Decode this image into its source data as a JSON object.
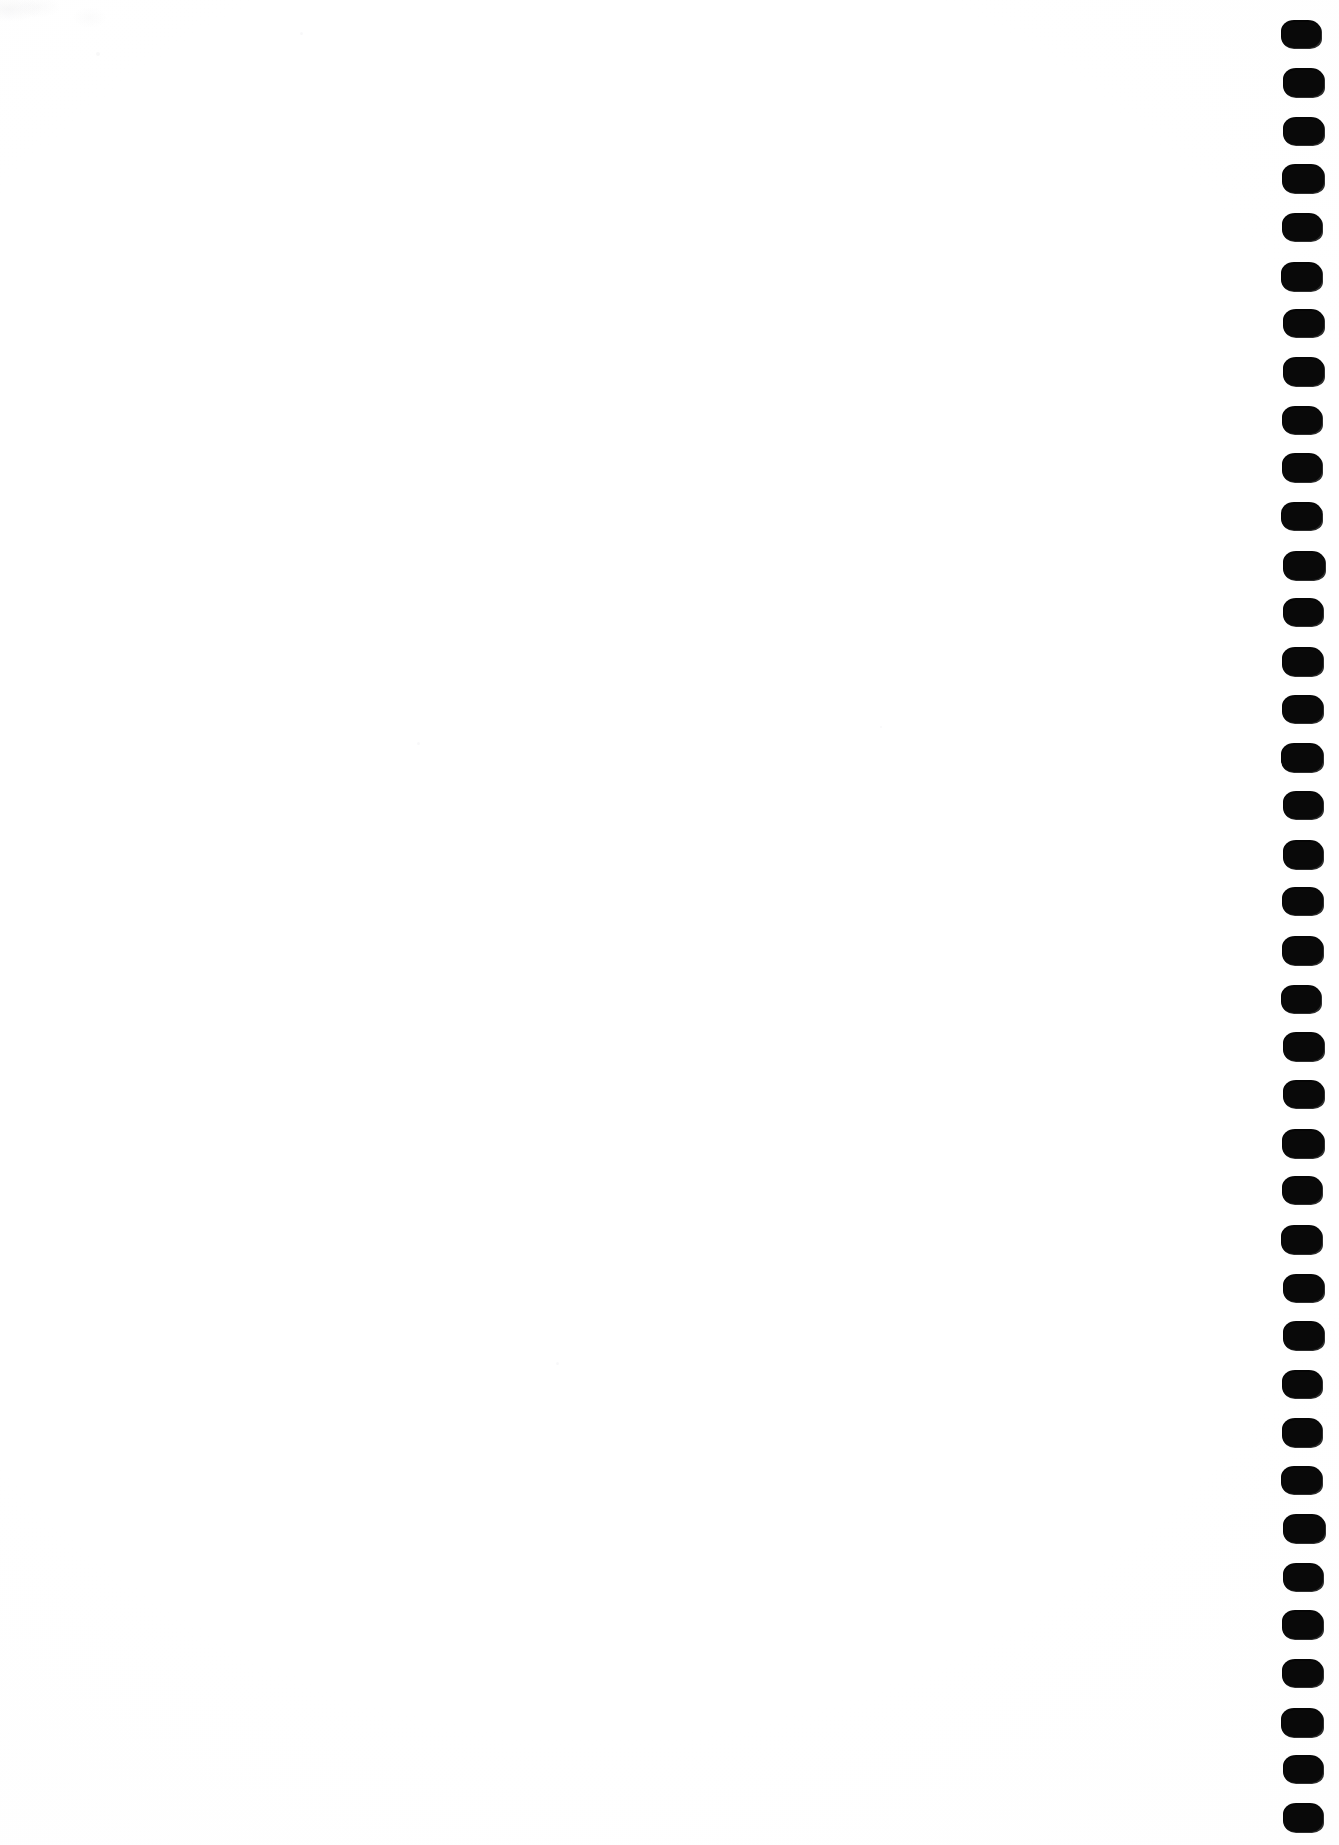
{
  "document": {
    "kind": "scanned-page",
    "title": "Scanned Blank Notebook Page",
    "page_label": "",
    "body_text": "",
    "visible_text": "",
    "width_px": 1339,
    "height_px": 1845
  },
  "colors": {
    "page_background": "#ffffff",
    "ink": "#050505",
    "smudge": "#f4f4f6"
  },
  "binding": {
    "name": "spiral-binding-holes",
    "edge": "right",
    "hole_shape": "rounded-rectangle",
    "hole_count": 38,
    "hole_width_px": 40,
    "hole_height_px": 28,
    "hole_pitch_px": 48.2,
    "first_hole_top_px": 20,
    "column_left_px": 1280,
    "hole_left_offset_px": 2,
    "right_margin_px": 17
  },
  "artifacts": {
    "smudge": {
      "name": "scan-smudge-top-left",
      "left_px": 0,
      "top_px": 0,
      "width_px": 115,
      "height_px": 30
    },
    "specks": [
      {
        "left_px": 417,
        "top_px": 742,
        "size_px": 3
      },
      {
        "left_px": 556,
        "top_px": 1362,
        "size_px": 3
      },
      {
        "left_px": 880,
        "top_px": 726,
        "size_px": 2
      },
      {
        "left_px": 300,
        "top_px": 32,
        "size_px": 3
      },
      {
        "left_px": 96,
        "top_px": 52,
        "size_px": 4
      }
    ]
  }
}
